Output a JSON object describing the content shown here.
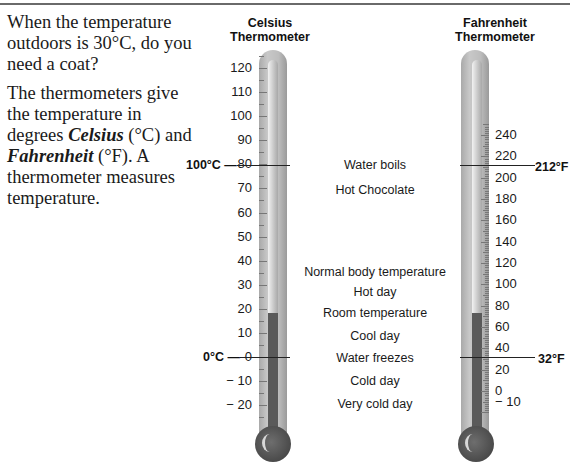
{
  "intro": {
    "question": "When the temperature outdoors is 30°C, do you need a coat?",
    "p2_a": "The thermometers give the temperature in degrees ",
    "celsius_word": "Celsius",
    "p2_b": " (°C) and ",
    "fahrenheit_word": "Fahrenheit",
    "p2_c": " (°F). A thermometer measures temperature."
  },
  "celsius": {
    "title_line1": "Celsius",
    "title_line2": "Thermometer",
    "labels": [
      "120",
      "110",
      "100",
      "90",
      "80",
      "70",
      "60",
      "50",
      "40",
      "30",
      "20",
      "10",
      "0",
      "− 10",
      "− 20"
    ],
    "mark_boil": "100°C —",
    "mark_freeze": "0°C —",
    "reading": 20
  },
  "fahrenheit": {
    "title_line1": "Fahrenheit",
    "title_line2": "Thermometer",
    "labels": [
      "240",
      "220",
      "200",
      "180",
      "160",
      "140",
      "120",
      "100",
      "80",
      "60",
      "40",
      "20",
      "0",
      "− 10"
    ],
    "mark_boil": "212°F",
    "mark_freeze": "32°F",
    "reading": 68
  },
  "notes": {
    "water_boils": "Water boils",
    "hot_chocolate": "Hot Chocolate",
    "body_temp": "Normal body temperature",
    "hot_day": "Hot day",
    "room_temp": "Room temperature",
    "cool_day": "Cool day",
    "water_freezes": "Water freezes",
    "cold_day": "Cold day",
    "very_cold_day": "Very cold day"
  }
}
